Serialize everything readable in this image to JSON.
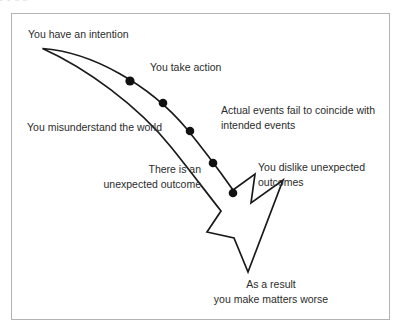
{
  "figure": {
    "clipped_text_above": "y                    y                          g      g",
    "frame": {
      "border_color": "#b3b3b3",
      "background_color": "#ffffff"
    },
    "arrow": {
      "stroke_color": "#1a1a1a",
      "fill_color": "#ffffff",
      "dot_color": "#111111",
      "dot_count": 5,
      "description": "curved tapering arrow sweeping from upper left down to lower right ending in a large arrowhead"
    },
    "labels": [
      {
        "id": "intention",
        "text": "You have an intention"
      },
      {
        "id": "take_action",
        "text": "You take action"
      },
      {
        "id": "actual_events",
        "text": "Actual events fail to coincide with\nintended events"
      },
      {
        "id": "misunderstand",
        "text": "You misunderstand the world"
      },
      {
        "id": "unexpected_outcome",
        "text": "There is an\nunexpected outcome"
      },
      {
        "id": "dislike",
        "text": "You dislike unexpected\noutcomes"
      },
      {
        "id": "as_a_result",
        "text": "As a result\nyou make matters worse"
      }
    ]
  }
}
